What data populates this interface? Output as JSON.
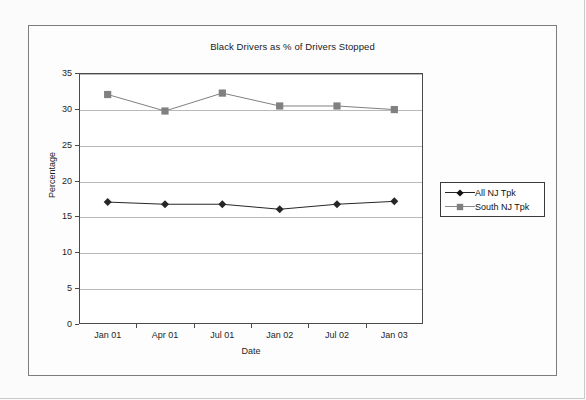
{
  "chart_data": {
    "type": "line",
    "title": "Black Drivers as % of Drivers Stopped",
    "xlabel": "Date",
    "ylabel": "Percentage",
    "categories": [
      "Jan 01",
      "Apr 01",
      "Jul 01",
      "Jan 02",
      "Jul 02",
      "Jan 03"
    ],
    "ylim": [
      0,
      35
    ],
    "yticks": [
      0,
      5,
      10,
      15,
      20,
      25,
      30,
      35
    ],
    "grid": "horizontal",
    "legend_position": "right",
    "series": [
      {
        "name": "All NJ Tpk",
        "marker": "diamond",
        "color": "#262626",
        "values": [
          17.0,
          16.7,
          16.7,
          16.0,
          16.7,
          17.1
        ]
      },
      {
        "name": "South NJ Tpk",
        "marker": "square",
        "color": "#808080",
        "values": [
          32.0,
          29.7,
          32.2,
          30.4,
          30.4,
          29.9
        ]
      }
    ]
  },
  "legend": {
    "entries": [
      {
        "label": "All NJ Tpk"
      },
      {
        "label": "South NJ Tpk"
      }
    ]
  },
  "colors": {
    "frame": "#7d7d7d",
    "axis": "#4a4a4a",
    "grid": "#b9b9b9",
    "page_background": "#fbfbfb",
    "plot_background": "#ffffff",
    "series_all_nj": "#262626",
    "series_south_nj": "#808080"
  }
}
